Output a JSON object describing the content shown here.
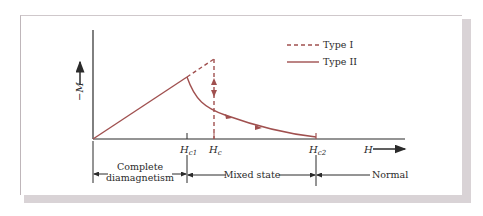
{
  "figure": {
    "y_axis_label": "−M",
    "x_axis_label": "H",
    "colors": {
      "curve": "#a0504f",
      "axis": "#2b2b2b",
      "card_shadow": "#d9d3d6"
    },
    "legend": [
      {
        "label": "Type I",
        "style": "dashed"
      },
      {
        "label": "Type II",
        "style": "solid"
      }
    ],
    "ticks": [
      {
        "label": "H",
        "sub": "c1"
      },
      {
        "label": "H",
        "sub": "c"
      },
      {
        "label": "H",
        "sub": "c2"
      }
    ],
    "regions": [
      {
        "line1": "Complete",
        "line2": "diamagnetism"
      },
      {
        "line1": "Mixed state"
      },
      {
        "line1": "Normal"
      }
    ]
  }
}
